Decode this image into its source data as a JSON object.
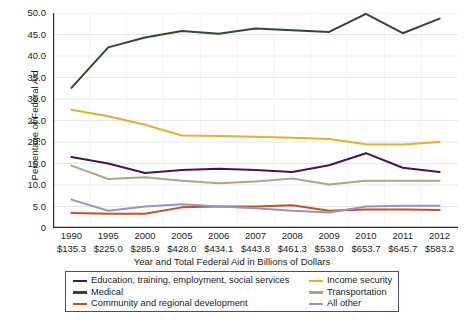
{
  "chart_data": {
    "type": "line",
    "title": "",
    "xlabel": "Year and Total Federal Aid in Billions of Dollars",
    "ylabel": "Percentage of Federal Aid",
    "ylim": [
      0,
      50
    ],
    "ytick_step": 5,
    "grid": true,
    "legend_position": "bottom",
    "categories": [
      "1990",
      "1995",
      "2000",
      "2005",
      "2006",
      "2007",
      "2008",
      "2009",
      "2010",
      "2011",
      "2012"
    ],
    "category_sublabels": [
      "$135.3",
      "$225.0",
      "$285.9",
      "$428.0",
      "$434.1",
      "$443.8",
      "$461.3",
      "$538.0",
      "$653.7",
      "$645.7",
      "$583.2"
    ],
    "ytick_labels": [
      "50.0",
      "45.0",
      "40.0",
      "35.0",
      "30.0",
      "25.0",
      "20.0",
      "15.0",
      "10.0",
      "5.0",
      "0"
    ],
    "ytick_values": [
      50,
      45,
      40,
      35,
      30,
      25,
      20,
      15,
      10,
      5,
      0
    ],
    "series": [
      {
        "name": "Education, training, employment, social services",
        "color": "#4a1452",
        "values": [
          16.5,
          15.0,
          12.8,
          13.5,
          13.8,
          13.5,
          13.0,
          14.6,
          17.4,
          14.0,
          13.0
        ]
      },
      {
        "name": "Medical",
        "color": "#2f4a2c",
        "values": [
          32.6,
          42.0,
          44.3,
          45.8,
          45.2,
          46.4,
          46.0,
          45.6,
          49.8,
          45.3,
          48.7
        ]
      },
      {
        "name": "Community and regional development",
        "color": "#c4531d",
        "values": [
          3.5,
          3.3,
          3.3,
          4.8,
          5.0,
          5.0,
          5.3,
          4.0,
          4.3,
          4.3,
          4.2
        ]
      },
      {
        "name": "Income security",
        "color": "#e3b226",
        "values": [
          27.5,
          26.0,
          24.0,
          21.5,
          21.4,
          21.2,
          21.0,
          20.7,
          19.5,
          19.4,
          20.0
        ]
      },
      {
        "name": "Transportation",
        "color": "#b3a583",
        "values": [
          14.5,
          11.4,
          11.8,
          11.0,
          10.4,
          10.8,
          11.5,
          10.1,
          11.0,
          11.0,
          11.0
        ]
      },
      {
        "name": "All other",
        "color": "#9a92c2",
        "values": [
          6.6,
          4.0,
          5.0,
          5.5,
          5.0,
          4.6,
          4.0,
          3.6,
          5.0,
          5.2,
          5.2
        ]
      }
    ]
  },
  "axis": {
    "y_title": "Percentage of Federal Aid",
    "x_title": "Year and Total Federal Aid in Billions of Dollars"
  },
  "legend": {
    "left_items": [
      {
        "label": "Education, training, employment, social services",
        "color": "#4a1452"
      },
      {
        "label": "Medical",
        "color": "#2f4a2c"
      },
      {
        "label": "Community and regional development",
        "color": "#c4531d"
      }
    ],
    "right_items": [
      {
        "label": "Income security",
        "color": "#e3b226"
      },
      {
        "label": "Transportation",
        "color": "#b3a583"
      },
      {
        "label": "All other",
        "color": "#9a92c2"
      }
    ]
  }
}
